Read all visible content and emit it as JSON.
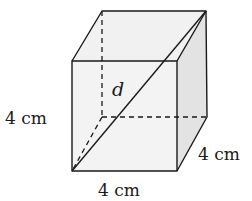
{
  "figure": {
    "type": "cube-diagram",
    "labels": {
      "height": "4 cm",
      "depth": "4 cm",
      "width": "4 cm",
      "diagonal": "d"
    },
    "colors": {
      "edge": "#1a1a1a",
      "front_face": "#f3f3f3",
      "top_face": "#f1f1f1",
      "right_face": "#e3e3e3"
    },
    "vertices": {
      "front_top_left": [
        72,
        61
      ],
      "front_top_right": [
        177,
        61
      ],
      "front_bottom_left": [
        72,
        171
      ],
      "front_bottom_right": [
        177,
        171
      ],
      "back_top_left": [
        102,
        11
      ],
      "back_top_right": [
        206,
        11
      ],
      "back_bottom_left": [
        102,
        117
      ],
      "back_bottom_right": [
        207,
        117
      ]
    }
  }
}
